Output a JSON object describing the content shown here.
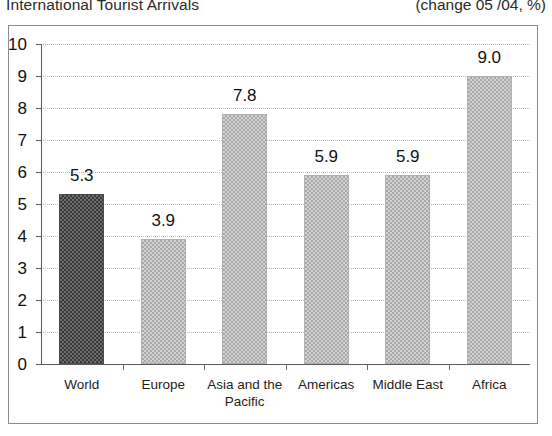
{
  "header": {
    "title": "International Tourist Arrivals",
    "subtitle_prefix": "(change 05",
    "subtitle_sup": "*",
    "subtitle_suffix": "/04, %)"
  },
  "chart_data": {
    "type": "bar",
    "title": "International Tourist Arrivals",
    "subtitle": "(change 05*/04, %)",
    "categories": [
      "World",
      "Europe",
      "Asia and the Pacific",
      "Americas",
      "Middle East",
      "Africa"
    ],
    "values": [
      5.3,
      3.9,
      7.8,
      5.9,
      5.9,
      9.0
    ],
    "data_labels": [
      "5.3",
      "3.9",
      "7.8",
      "5.9",
      "5.9",
      "9.0"
    ],
    "xlabel": "",
    "ylabel": "",
    "ylim": [
      0,
      10
    ],
    "ytick_labels": [
      "10",
      "9",
      "8",
      "7",
      "6",
      "5",
      "4",
      "3",
      "2",
      "1",
      "0"
    ],
    "ytick_values": [
      10,
      9,
      8,
      7,
      6,
      5,
      4,
      3,
      2,
      1,
      0
    ],
    "grid": true,
    "grid_style": "dotted-horizontal",
    "legend": false,
    "series_colors": {
      "highlight": "#4a4a4a",
      "default": "#c8c8c8"
    },
    "highlight_category": "World"
  }
}
